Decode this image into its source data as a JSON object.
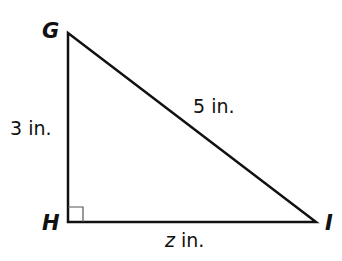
{
  "diagram": {
    "type": "right-triangle",
    "vertices": {
      "G": {
        "label": "G",
        "x": 68,
        "y": 33
      },
      "H": {
        "label": "H",
        "x": 68,
        "y": 222
      },
      "I": {
        "label": "I",
        "x": 316,
        "y": 222
      }
    },
    "sides": {
      "GH": {
        "value": "3",
        "unit": "in.",
        "text": "3 in."
      },
      "GI": {
        "value": "5",
        "unit": "in.",
        "text": "5 in."
      },
      "HI": {
        "variable": "z",
        "unit": "in.",
        "text": "z in."
      }
    },
    "right_angle_at": "H",
    "stroke_color": "#111111"
  }
}
